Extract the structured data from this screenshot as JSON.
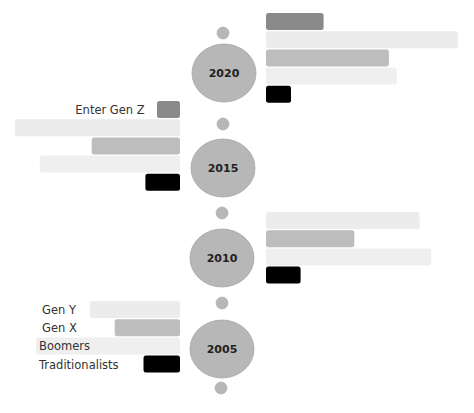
{
  "chart_data": {
    "type": "bar",
    "orientation": "horizontal",
    "layout": "timeline-alternating",
    "title": "",
    "series_names": [
      "Gen Z",
      "Gen Y",
      "Gen X",
      "Boomers",
      "Traditionalists"
    ],
    "colors": {
      "Gen Z": "#8a8a8a",
      "Gen Y": "#ececec",
      "Gen X": "#bdbdbd",
      "Boomers": "#efefef",
      "Traditionalists": "#000000",
      "milestone": "#b7b7b7",
      "milestone_edge": "#a6a6a6"
    },
    "scale_max": 100,
    "groups": [
      {
        "year": "2020",
        "side": "right",
        "values": {
          "Gen Z": 30,
          "Gen Y": 100,
          "Gen X": 64,
          "Boomers": 68,
          "Traditionalists": 13
        }
      },
      {
        "year": "2015",
        "side": "left",
        "values": {
          "Gen Z": 12,
          "Gen Y": 86,
          "Gen X": 46,
          "Boomers": 73,
          "Traditionalists": 18
        }
      },
      {
        "year": "2010",
        "side": "right",
        "values": {
          "Gen Y": 80,
          "Gen X": 46,
          "Boomers": 86,
          "Traditionalists": 18
        }
      },
      {
        "year": "2005",
        "side": "left",
        "values": {
          "Gen Y": 47,
          "Gen X": 34,
          "Boomers": 75,
          "Traditionalists": 19
        }
      }
    ],
    "annotations": {
      "enter_gen_z": "Enter Gen Z",
      "legend_labels": [
        "Gen Y",
        "Gen X",
        "Boomers",
        "Traditionalists"
      ]
    }
  }
}
